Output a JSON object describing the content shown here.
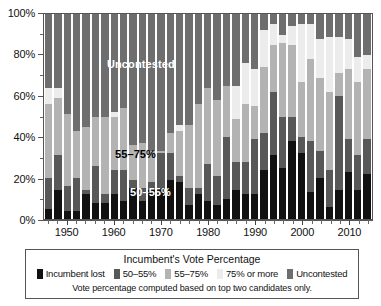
{
  "chart_data": {
    "type": "bar",
    "stacked": true,
    "stack_mode": "percent",
    "title": "",
    "xlabel": "",
    "ylabel": "",
    "ylim": [
      0,
      100
    ],
    "grid": false,
    "legend_position": "bottom",
    "legend_title": "Incumbent's Vote Percentage",
    "footnote": "Vote percentage computed based on top two candidates only.",
    "y_tick_labels": [
      "0%",
      "20%",
      "40%",
      "60%",
      "80%",
      "100%"
    ],
    "y_tick_values": [
      0,
      20,
      40,
      60,
      80,
      100
    ],
    "y_minor_tick_values": [
      10,
      30,
      50,
      70,
      90
    ],
    "x_tick_labels": [
      "1950",
      "1960",
      "1970",
      "1980",
      "1990",
      "2000",
      "2010"
    ],
    "x_tick_values": [
      1950,
      1960,
      1970,
      1980,
      1990,
      2000,
      2010
    ],
    "categories": [
      1946,
      1948,
      1950,
      1952,
      1954,
      1956,
      1958,
      1960,
      1962,
      1964,
      1966,
      1968,
      1970,
      1972,
      1974,
      1976,
      1978,
      1980,
      1982,
      1984,
      1986,
      1988,
      1990,
      1992,
      1994,
      1996,
      1998,
      2000,
      2002,
      2004,
      2006,
      2008,
      2010,
      2012,
      2014
    ],
    "series": [
      {
        "name": "Incumbent lost",
        "color": "#111111",
        "values": [
          5,
          14,
          4,
          4,
          12,
          8,
          8,
          12,
          9,
          15,
          9,
          14,
          15,
          19,
          18,
          7,
          12,
          9,
          7,
          10,
          14,
          12,
          12,
          24,
          31,
          25,
          38,
          32,
          13,
          20,
          6,
          14,
          23,
          14,
          22
        ]
      },
      {
        "name": "50–55%",
        "color": "#585858",
        "values": [
          15,
          17,
          12,
          16,
          2,
          18,
          4,
          12,
          15,
          4,
          6,
          4,
          17,
          13,
          3,
          8,
          3,
          18,
          14,
          30,
          14,
          16,
          27,
          18,
          31,
          25,
          12,
          8,
          25,
          13,
          18,
          46,
          16,
          17,
          17
        ]
      },
      {
        "name": "55–75%",
        "color": "#b3b3b3",
        "values": [
          36,
          28,
          35,
          23,
          31,
          24,
          38,
          26,
          30,
          17,
          22,
          15,
          1,
          10,
          22,
          31,
          41,
          37,
          37,
          25,
          21,
          28,
          16,
          32,
          23,
          36,
          35,
          27,
          40,
          36,
          38,
          11,
          34,
          36,
          34
        ]
      },
      {
        "name": "75% or more",
        "color": "#ececec",
        "values": [
          8,
          5,
          0,
          0,
          0,
          0,
          0,
          2,
          0,
          0,
          0,
          0,
          0,
          0,
          3,
          0,
          0,
          0,
          0,
          0,
          16,
          20,
          18,
          18,
          10,
          4,
          9,
          28,
          17,
          19,
          27,
          18,
          15,
          12,
          7
        ]
      },
      {
        "name": "Uncontested",
        "color": "#6e6e6e",
        "values": [
          36,
          36,
          49,
          57,
          55,
          50,
          50,
          48,
          46,
          64,
          63,
          67,
          67,
          58,
          54,
          54,
          44,
          36,
          42,
          35,
          35,
          24,
          27,
          8,
          5,
          10,
          6,
          5,
          5,
          12,
          11,
          11,
          12,
          21,
          20
        ]
      }
    ],
    "annotations": [
      {
        "text": "Uncontested",
        "x_px": 63,
        "y_px": 44,
        "style": "light"
      },
      {
        "text": "55–75%",
        "x_px": 71,
        "y_px": 134,
        "style": "dark"
      },
      {
        "text": "50–55%",
        "x_px": 86,
        "y_px": 172,
        "style": "light"
      }
    ]
  }
}
